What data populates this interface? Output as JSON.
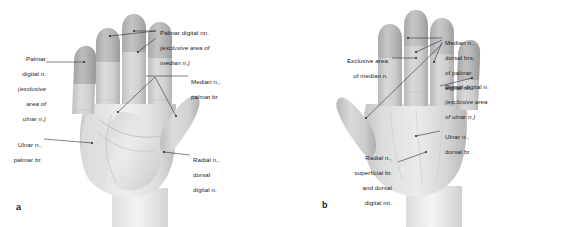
{
  "figure": {
    "background_color": "#ffffff",
    "line_color": "#2b2f45",
    "text_color": "#1b1b1b"
  },
  "panels": [
    {
      "id": "a",
      "letter": "a",
      "view": "palmar",
      "description": "Palmar (volar) view of right hand showing cutaneous nerve territories",
      "labels": [
        {
          "name": "palmar-digital-nn-median",
          "align": "left",
          "lines": [
            "Palmar digital nn.",
            "(exclusive area of",
            "median n.)"
          ],
          "italic_lines": [
            1,
            2
          ]
        },
        {
          "name": "palmar-digital-n-ulnar",
          "align": "right",
          "lines": [
            "Palmar",
            "digital n.",
            "(exclusive",
            "area of",
            "ulnar n.)"
          ],
          "italic_lines": [
            2,
            3,
            4
          ]
        },
        {
          "name": "median-n-palmar-br",
          "align": "left",
          "lines": [
            "Median n.,",
            "palmar br."
          ],
          "italic_lines": []
        },
        {
          "name": "ulnar-n-palmar-br",
          "align": "right",
          "lines": [
            "Ulnar n.,",
            "palmar br."
          ],
          "italic_lines": []
        },
        {
          "name": "radial-n-dorsal-digital-n",
          "align": "left",
          "lines": [
            "Radial n.,",
            "dorsal",
            "digital n."
          ],
          "italic_lines": []
        }
      ]
    },
    {
      "id": "b",
      "letter": "b",
      "view": "dorsal",
      "description": "Dorsal view of right hand showing cutaneous nerve territories",
      "labels": [
        {
          "name": "median-n-dorsal-brs",
          "align": "left",
          "lines": [
            "Median n.,",
            "dorsal brs.",
            "of palmar",
            "digital nn."
          ],
          "italic_lines": []
        },
        {
          "name": "exclusive-area-of-median-n",
          "align": "right",
          "lines": [
            "Exclusive area",
            "of median n."
          ],
          "italic_lines": [
            0,
            1
          ]
        },
        {
          "name": "dorsal-digital-n-ulnar",
          "align": "left",
          "lines": [
            "Dorsal digital n.",
            "(exclusive area",
            "of ulnar n.)"
          ],
          "italic_lines": [
            1,
            2
          ]
        },
        {
          "name": "ulnar-n-dorsal-br",
          "align": "left",
          "lines": [
            "Ulnar n.,",
            "dorsal br."
          ],
          "italic_lines": []
        },
        {
          "name": "radial-n-superficial-br",
          "align": "right",
          "lines": [
            "Radial n.,",
            "superficial br.",
            "and dorsal",
            "digital nn."
          ],
          "italic_lines": []
        }
      ]
    }
  ]
}
